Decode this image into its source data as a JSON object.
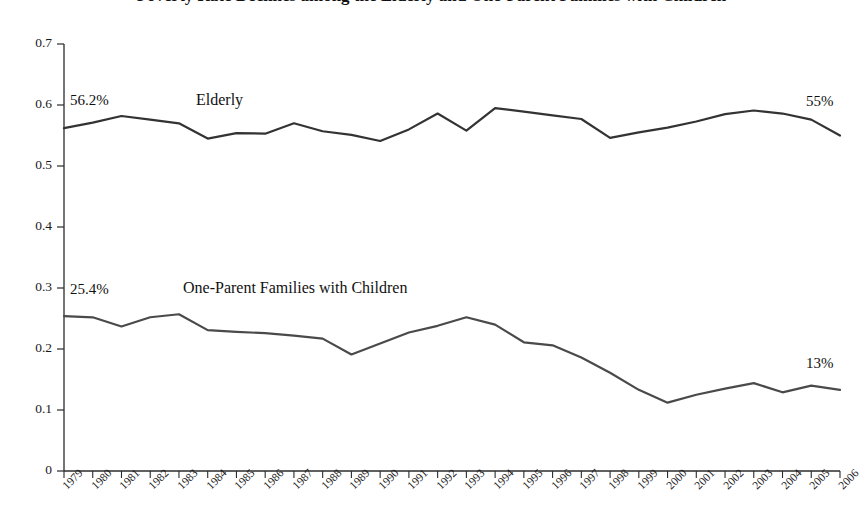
{
  "chart_data": {
    "type": "line",
    "title": "Poverty Rate Declines among the Elderly and One-Parent Families with Children",
    "xlabel": "",
    "ylabel": "",
    "ylim": [
      0,
      0.7
    ],
    "ytick_labels": [
      "0",
      "0.1",
      "0.2",
      "0.3",
      "0.4",
      "0.5",
      "0.6",
      "0.7"
    ],
    "ytick_values": [
      0,
      0.1,
      0.2,
      0.3,
      0.4,
      0.5,
      0.6,
      0.7
    ],
    "grid": false,
    "legend": "inline-annotations",
    "categories": [
      "1979",
      "1980",
      "1981",
      "1982",
      "1983",
      "1984",
      "1985",
      "1986",
      "1987",
      "1988",
      "1989",
      "1990",
      "1991",
      "1992",
      "1993",
      "1994",
      "1995",
      "1996",
      "1997",
      "1998",
      "1999",
      "2000",
      "2001",
      "2002",
      "2003",
      "2004",
      "2005",
      "2006"
    ],
    "series": [
      {
        "name": "Elderly",
        "color": "#333333",
        "values": [
          0.562,
          0.571,
          0.582,
          0.576,
          0.57,
          0.545,
          0.554,
          0.553,
          0.57,
          0.557,
          0.551,
          0.541,
          0.56,
          0.586,
          0.558,
          0.595,
          0.589,
          0.583,
          0.577,
          0.546,
          0.555,
          0.563,
          0.573,
          0.585,
          0.591,
          0.586,
          0.576,
          0.55
        ],
        "start_label": "56.2%",
        "end_label": "55%"
      },
      {
        "name": "One-Parent Families with Children",
        "color": "#4a4a4a",
        "values": [
          0.254,
          0.252,
          0.237,
          0.252,
          0.257,
          0.231,
          0.228,
          0.226,
          0.222,
          0.217,
          0.191,
          0.209,
          0.227,
          0.238,
          0.252,
          0.24,
          0.211,
          0.206,
          0.186,
          0.161,
          0.133,
          0.112,
          0.125,
          0.135,
          0.144,
          0.129,
          0.14,
          0.133
        ],
        "start_label": "25.4%",
        "end_label": "13%"
      }
    ]
  },
  "annotations": {
    "elderly_start": "56.2%",
    "elderly_name": "Elderly",
    "elderly_end": "55%",
    "oneparent_start": "25.4%",
    "oneparent_name": "One-Parent Families with Children",
    "oneparent_end": "13%"
  }
}
